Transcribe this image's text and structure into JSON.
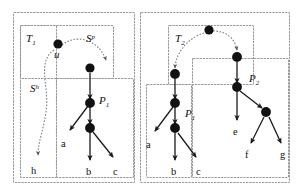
{
  "figure": {
    "background": "#ffffff",
    "width": 193,
    "node_color": "#111111",
    "box_color": "#9a9a9a",
    "edge_color": "#4d4d4d"
  },
  "panels": [
    {
      "id": "left",
      "boxes": [
        {
          "id": "outer-left",
          "label": ""
        },
        {
          "id": "t1",
          "label": "T",
          "sub": "1"
        },
        {
          "id": "p1-left",
          "label": "P",
          "sub": "1"
        },
        {
          "id": "h-box",
          "label": ""
        }
      ],
      "curve_labels": [
        {
          "id": "sp",
          "base": "S",
          "sup": "p"
        },
        {
          "id": "sh",
          "base": "S",
          "sup": "h"
        }
      ],
      "node_labels": [
        {
          "id": "u",
          "text": "u",
          "style": "italic"
        },
        {
          "id": "h",
          "text": "h",
          "style": "roman"
        },
        {
          "id": "a",
          "text": "a",
          "style": "roman"
        },
        {
          "id": "b",
          "text": "b",
          "style": "roman"
        },
        {
          "id": "c",
          "text": "c",
          "style": "roman"
        }
      ]
    },
    {
      "id": "right",
      "boxes": [
        {
          "id": "outer-right",
          "label": ""
        },
        {
          "id": "t2",
          "label": "T",
          "sub": "2"
        },
        {
          "id": "p2",
          "label": "P",
          "sub": "2"
        },
        {
          "id": "p1-right",
          "label": "P",
          "sub": "1"
        }
      ],
      "node_labels": [
        {
          "id": "a2",
          "text": "a",
          "style": "roman"
        },
        {
          "id": "b2",
          "text": "b",
          "style": "roman"
        },
        {
          "id": "c2",
          "text": "c",
          "style": "roman"
        },
        {
          "id": "e",
          "text": "e",
          "style": "roman"
        },
        {
          "id": "f",
          "text": "f",
          "style": "roman"
        },
        {
          "id": "g",
          "text": "g",
          "style": "roman"
        }
      ]
    }
  ],
  "text": {
    "T1_base": "T",
    "T1_sub": "1",
    "T2_base": "T",
    "T2_sub": "2",
    "P1L_base": "P",
    "P1L_sub": "1",
    "P1R_base": "P",
    "P1R_sub": "1",
    "P2_base": "P",
    "P2_sub": "2",
    "Sp_base": "S",
    "Sp_sup": "p",
    "Sh_base": "S",
    "Sh_sup": "h",
    "u": "u",
    "h": "h",
    "aL": "a",
    "bL": "b",
    "cL": "c",
    "aR": "a",
    "bR": "b",
    "cR": "c",
    "e": "e",
    "f": "f",
    "g": "g"
  }
}
